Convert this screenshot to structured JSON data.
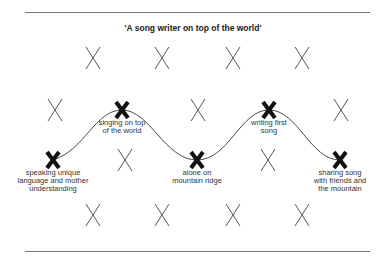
{
  "diagram": {
    "title": "'A song writer on top of the world'",
    "colors": {
      "line": "#333333",
      "rule": "#777777",
      "text": "#222222"
    },
    "small_markers": [
      {
        "x": 93,
        "y": 58
      },
      {
        "x": 162,
        "y": 58
      },
      {
        "x": 233,
        "y": 58
      },
      {
        "x": 302,
        "y": 58
      },
      {
        "x": 55,
        "y": 110
      },
      {
        "x": 198,
        "y": 110
      },
      {
        "x": 341,
        "y": 110
      },
      {
        "x": 125,
        "y": 160
      },
      {
        "x": 268,
        "y": 160
      },
      {
        "x": 93,
        "y": 215
      },
      {
        "x": 162,
        "y": 215
      },
      {
        "x": 233,
        "y": 215
      },
      {
        "x": 302,
        "y": 215
      }
    ],
    "key_points": [
      {
        "x": 53,
        "y": 160,
        "label": "speaking unique\nlanguage and mother\nunderstanding"
      },
      {
        "x": 122,
        "y": 110,
        "label": "singing on top\nof the world"
      },
      {
        "x": 197,
        "y": 160,
        "label": "alone on\nmountain ridge"
      },
      {
        "x": 269,
        "y": 110,
        "label": "writing first\nsong"
      },
      {
        "x": 340,
        "y": 160,
        "label": "sharing song\nwith friends and\nthe mountain"
      }
    ]
  }
}
